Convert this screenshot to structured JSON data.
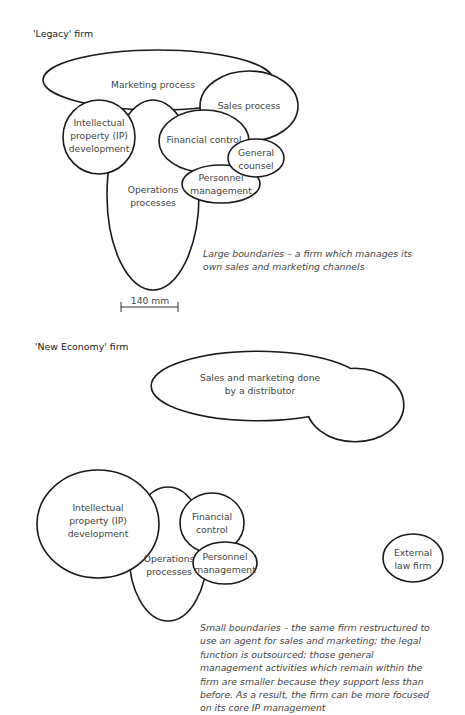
{
  "legacy": {
    "title": "'Legacy' firm",
    "labels": {
      "marketing": "Marketing process",
      "sales": "Sales process",
      "ip_1": "Intellectual",
      "ip_2": "property (IP)",
      "ip_3": "development",
      "financial": "Financial control",
      "counsel_1": "General",
      "counsel_2": "counsel",
      "personnel_1": "Personnel",
      "personnel_2": "management",
      "operations_1": "Operations",
      "operations_2": "processes"
    },
    "caption": "Large boundaries – a firm which manages its own sales and marketing channels",
    "scale_bar": "140 mm"
  },
  "new_economy": {
    "title": "'New Economy' firm",
    "labels": {
      "distributor_1": "Sales and marketing done",
      "distributor_2": "by a distributor",
      "ip_1": "Intellectual",
      "ip_2": "property (IP)",
      "ip_3": "development",
      "financial_1": "Financial",
      "financial_2": "control",
      "personnel_1": "Personnel",
      "personnel_2": "management",
      "operations_1": "Operations",
      "operations_2": "processes",
      "law_1": "External",
      "law_2": "law firm"
    },
    "caption": "Small boundaries – the same firm restructured to use an agent for sales and marketing; the legal function is outsourced; those general management activities which remain within the firm are smaller because they support less than before. As a result, the firm can be more focused on its core IP management"
  }
}
